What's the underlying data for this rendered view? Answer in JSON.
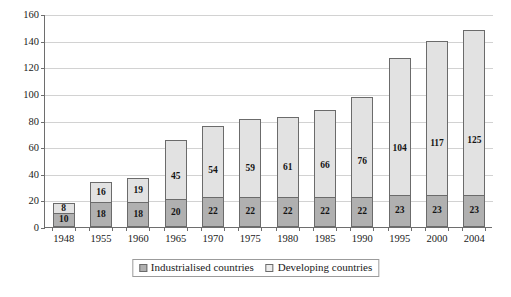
{
  "chart_data": {
    "type": "bar",
    "stacked": true,
    "title": "",
    "subtitle": "",
    "xlabel": "",
    "ylabel": "",
    "ylim": [
      0,
      160
    ],
    "ytick_step": 20,
    "yticks": [
      0,
      20,
      40,
      60,
      80,
      100,
      120,
      140,
      160
    ],
    "grid": true,
    "legend_position": "bottom",
    "categories": [
      "1948",
      "1955",
      "1960",
      "1965",
      "1970",
      "1975",
      "1980",
      "1985",
      "1990",
      "1995",
      "2000",
      "2004"
    ],
    "series": [
      {
        "name": "Industrialised countries",
        "color": "#b0b0b0",
        "stack_position": "bottom",
        "values": [
          10,
          18,
          18,
          20,
          22,
          22,
          22,
          22,
          22,
          23,
          23,
          23
        ]
      },
      {
        "name": "Developing countries",
        "color": "#e2e2e2",
        "stack_position": "top",
        "values": [
          8,
          16,
          19,
          45,
          54,
          59,
          61,
          66,
          76,
          104,
          117,
          125
        ]
      }
    ],
    "totals": [
      18,
      34,
      37,
      65,
      76,
      81,
      83,
      88,
      98,
      127,
      140,
      148
    ]
  },
  "legend": {
    "items": [
      {
        "label": "Industrialised countries",
        "swatch": "industrial"
      },
      {
        "label": "Developing countries",
        "swatch": "developing"
      }
    ]
  },
  "colors": {
    "industrialised": "#b0b0b0",
    "developing": "#e2e2e2",
    "axis": "#6e6e6e",
    "gridline": "#d2d2d2",
    "background": "#ffffff"
  }
}
